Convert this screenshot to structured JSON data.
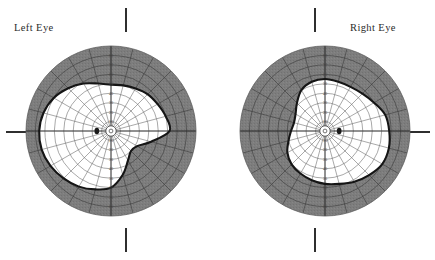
{
  "figure": {
    "kind": "goldmann-visual-field-perimetry-pair",
    "left_eye_label": "Left Eye",
    "right_eye_label": "Right Eye",
    "background_color": "#ffffff",
    "ink_color": "#2b2b2b",
    "shaded_field_color": "#7d7d7d",
    "seeing_field_color": "#ffffff",
    "isopter_line_color": "#151515",
    "grid_line_color": "#6e6e6e"
  },
  "ticks": {
    "top_marker": "|",
    "bottom_marker": "|",
    "side_marker": "—",
    "count_per_chart": 3
  },
  "chart_data": {
    "type": "line",
    "xlabel": "Horizontal meridian (degrees)",
    "ylabel": "Vertical meridian (degrees)",
    "grid": true,
    "legend_position": "none",
    "coordinate_system": "polar-degrees",
    "radial_tick_labels": [
      "10",
      "20",
      "30",
      "40",
      "50",
      "60",
      "70",
      "80"
    ],
    "radial_tick_degrees": [
      10,
      20,
      30,
      40,
      50,
      60,
      70,
      80
    ],
    "meridian_spacing_degrees": 15,
    "outer_limit_degrees": 90,
    "series": [
      {
        "name": "Left Eye isopter (seeing field boundary)",
        "eye": "OS",
        "fixation_degrees": [
          0,
          0
        ],
        "blind_spot_center_degrees": [
          -15,
          1.5
        ],
        "blind_spot_size_degrees": [
          5,
          7
        ],
        "polar_boundary": [
          {
            "angle": 0,
            "radius": 62
          },
          {
            "angle": 15,
            "radius": 60
          },
          {
            "angle": 30,
            "radius": 57
          },
          {
            "angle": 45,
            "radius": 55
          },
          {
            "angle": 60,
            "radius": 52
          },
          {
            "angle": 75,
            "radius": 50
          },
          {
            "angle": 90,
            "radius": 49
          },
          {
            "angle": 105,
            "radius": 52
          },
          {
            "angle": 120,
            "radius": 58
          },
          {
            "angle": 135,
            "radius": 64
          },
          {
            "angle": 150,
            "radius": 70
          },
          {
            "angle": 165,
            "radius": 74
          },
          {
            "angle": 180,
            "radius": 76
          },
          {
            "angle": 195,
            "radius": 76
          },
          {
            "angle": 210,
            "radius": 74
          },
          {
            "angle": 225,
            "radius": 71
          },
          {
            "angle": 240,
            "radius": 68
          },
          {
            "angle": 255,
            "radius": 64
          },
          {
            "angle": 270,
            "radius": 60
          },
          {
            "angle": 285,
            "radius": 48
          },
          {
            "angle": 300,
            "radius": 36
          },
          {
            "angle": 315,
            "radius": 30
          },
          {
            "angle": 330,
            "radius": 32
          },
          {
            "angle": 345,
            "radius": 44
          }
        ],
        "defect_description": "Broad inferotemporal constriction; field preserved nasally"
      },
      {
        "name": "Right Eye isopter (seeing field boundary)",
        "eye": "OD",
        "fixation_degrees": [
          0,
          0
        ],
        "blind_spot_center_degrees": [
          15,
          1.5
        ],
        "blind_spot_size_degrees": [
          5,
          7
        ],
        "polar_boundary": [
          {
            "angle": 0,
            "radius": 68
          },
          {
            "angle": 15,
            "radius": 66
          },
          {
            "angle": 30,
            "radius": 60
          },
          {
            "angle": 45,
            "radius": 56
          },
          {
            "angle": 60,
            "radius": 54
          },
          {
            "angle": 75,
            "radius": 54
          },
          {
            "angle": 90,
            "radius": 55
          },
          {
            "angle": 105,
            "radius": 54
          },
          {
            "angle": 120,
            "radius": 50
          },
          {
            "angle": 135,
            "radius": 42
          },
          {
            "angle": 150,
            "radius": 36
          },
          {
            "angle": 165,
            "radius": 34
          },
          {
            "angle": 180,
            "radius": 36
          },
          {
            "angle": 195,
            "radius": 40
          },
          {
            "angle": 210,
            "radius": 46
          },
          {
            "angle": 225,
            "radius": 50
          },
          {
            "angle": 240,
            "radius": 52
          },
          {
            "angle": 255,
            "radius": 54
          },
          {
            "angle": 270,
            "radius": 56
          },
          {
            "angle": 285,
            "radius": 58
          },
          {
            "angle": 300,
            "radius": 62
          },
          {
            "angle": 315,
            "radius": 66
          },
          {
            "angle": 330,
            "radius": 70
          },
          {
            "angle": 345,
            "radius": 70
          }
        ],
        "defect_description": "Nasal and superonasal constriction; temporal field relatively preserved"
      }
    ]
  }
}
